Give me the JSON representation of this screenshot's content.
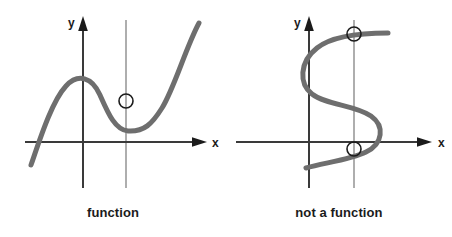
{
  "figure": {
    "title": "",
    "background_color": "#ffffff",
    "panels": [
      {
        "id": "left-panel",
        "caption": "function",
        "axis_labels": {
          "x": "x",
          "y": "y"
        },
        "vertical_line_test": {
          "line_color": "#9a9a9a",
          "intersection_count": 1,
          "markers": [
            {
              "cx": 126,
              "cy": 101
            }
          ]
        },
        "curve": {
          "color": "#6e6e6e",
          "width": 5,
          "shape": "cubic"
        },
        "axes": {
          "color": "#3a3a3a",
          "origin": {
            "x": 83,
            "y": 142
          },
          "x_axis_from": 25,
          "x_axis_to": 205,
          "y_axis_top": 20,
          "y_axis_bottom": 188
        }
      },
      {
        "id": "right-panel",
        "caption": "not a function",
        "axis_labels": {
          "x": "x",
          "y": "y"
        },
        "vertical_line_test": {
          "line_color": "#9a9a9a",
          "intersection_count": 2,
          "markers": [
            {
              "cx": 354,
              "cy": 34
            },
            {
              "cx": 354,
              "cy": 149
            }
          ]
        },
        "curve": {
          "color": "#6e6e6e",
          "width": 5,
          "shape": "sideways-s"
        },
        "axes": {
          "color": "#3a3a3a",
          "origin": {
            "x": 309,
            "y": 142
          },
          "x_axis_from": 236,
          "x_axis_to": 430,
          "y_axis_top": 20,
          "y_axis_bottom": 188
        }
      }
    ],
    "marker_style": {
      "stroke": "#1b1b1b",
      "fill": "none",
      "radius": 7,
      "stroke_width": 1.6
    }
  }
}
